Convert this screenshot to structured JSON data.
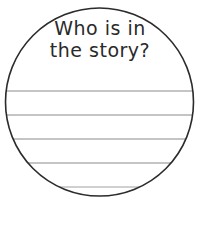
{
  "worksheet": {
    "prompt_lines": [
      "Who is in",
      "the story?"
    ],
    "writing_line_count": 5,
    "colors": {
      "circle_stroke": "#2b2b2b",
      "line_stroke": "#8a8a8a",
      "text": "#2a2a2a",
      "background": "#ffffff"
    }
  }
}
